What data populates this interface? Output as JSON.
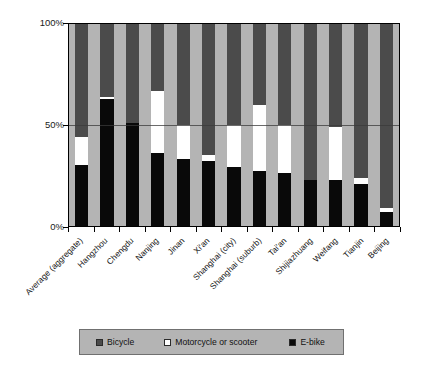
{
  "chart_data": {
    "type": "bar",
    "subtype": "stacked-100-percent",
    "title": "",
    "xlabel": "",
    "ylabel": "",
    "ylim": [
      0,
      100
    ],
    "ytick_labels": [
      "0%",
      "50%",
      "100%"
    ],
    "ytick_values": [
      0,
      50,
      100
    ],
    "grid": true,
    "gridlines_at": [
      50
    ],
    "legend_position": "bottom",
    "categories": [
      "Average (aggregate)",
      "Hangzhou",
      "Chengdu",
      "Nanjing",
      "Jinan",
      "Xi'an",
      "Shanghai (city)",
      "Shanghai (suburb)",
      "Tai'an",
      "Shijiazhuang",
      "Weifang",
      "Tianjin",
      "Beijing"
    ],
    "series": [
      {
        "name": "E-bike",
        "color": "#0a0a0a",
        "values": [
          30,
          63,
          51,
          36,
          33,
          32,
          29,
          27,
          26,
          23,
          23,
          21,
          7
        ]
      },
      {
        "name": "Motorcycle or scooter",
        "color": "#ffffff",
        "values": [
          14,
          1,
          0,
          31,
          17,
          3,
          21,
          33,
          24,
          0,
          26,
          3,
          2
        ]
      },
      {
        "name": "Bicycle",
        "color": "#4b4b4b",
        "values": [
          56,
          36,
          49,
          33,
          50,
          65,
          50,
          40,
          50,
          77,
          51,
          76,
          91
        ]
      }
    ]
  },
  "legend": {
    "items": [
      {
        "label": "Bicycle",
        "swatch": "bicycle"
      },
      {
        "label": "Motorcycle or scooter",
        "swatch": "motor"
      },
      {
        "label": "E-bike",
        "swatch": "ebike"
      }
    ]
  }
}
